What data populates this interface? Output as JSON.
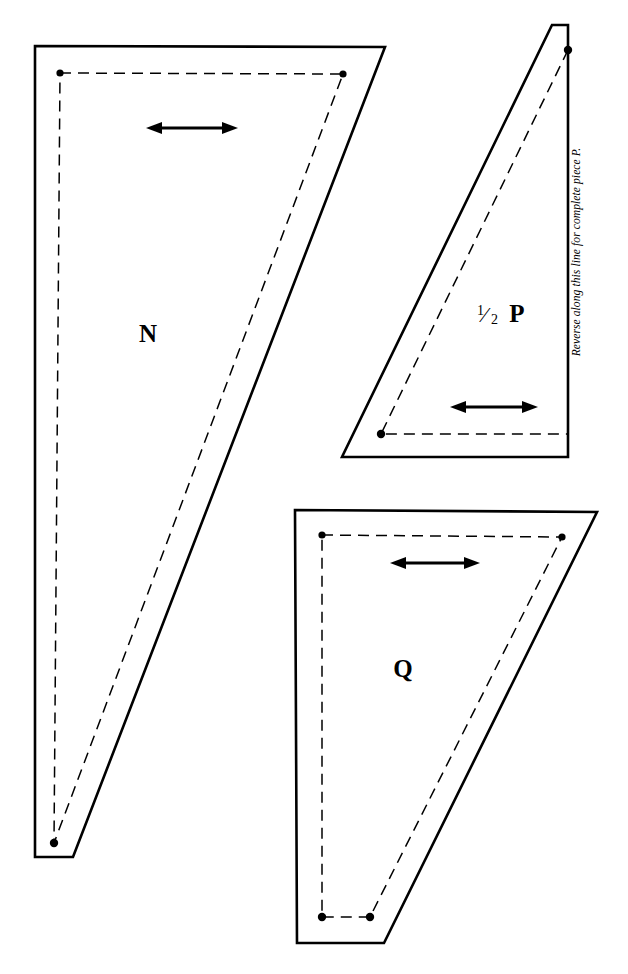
{
  "document": {
    "kind": "sewing-pattern-sheet",
    "background_color": "#ffffff",
    "ink_color": "#000000",
    "width": 628,
    "height": 974
  },
  "pieces": [
    {
      "id": "n",
      "label": "N",
      "label_x": 148,
      "label_y": 342,
      "cut_path": "M 35 46 L 385 47 L 73 857 L 35 857 Z",
      "stitch_path": "M 60 73 L 343 74 L 54 843 L 60 73",
      "dots": [
        {
          "cx": 60,
          "cy": 73,
          "r": 3.6
        },
        {
          "cx": 343,
          "cy": 74,
          "r": 3.6
        },
        {
          "cx": 54,
          "cy": 843,
          "r": 4.2
        }
      ],
      "grain_arrow": {
        "x1": 148,
        "x2": 236,
        "y": 128
      }
    },
    {
      "id": "p",
      "label_fraction_numerator": "1",
      "label_fraction_denominator": "2",
      "label": "P",
      "label_x": 500,
      "label_y": 322,
      "cut_path": "M 552 25 L 568 25 L 568 457 L 342 457 Z",
      "stitch_path": "M 568 50 L 381 434 L 568 434",
      "fold_path": "M 568 28 L 568 455",
      "dots": [
        {
          "cx": 568,
          "cy": 50,
          "r": 4.2
        },
        {
          "cx": 381,
          "cy": 434,
          "r": 4.2
        }
      ],
      "grain_arrow": {
        "x1": 452,
        "x2": 536,
        "y": 407
      },
      "fold_note": "Reverse along this line for complete piece P.",
      "fold_note_x": 580,
      "fold_note_y": 252
    },
    {
      "id": "q",
      "label": "Q",
      "label_x": 403,
      "label_y": 677,
      "cut_path": "M 295 510 L 597 512 L 384 943 L 297 943 Z",
      "stitch_path": "M 322 535 L 562 537 L 370 917 L 322 917 L 322 535",
      "dots": [
        {
          "cx": 322,
          "cy": 535,
          "r": 3.6
        },
        {
          "cx": 562,
          "cy": 537,
          "r": 3.6
        },
        {
          "cx": 370,
          "cy": 917,
          "r": 4.2
        },
        {
          "cx": 322,
          "cy": 917,
          "r": 4.2
        }
      ],
      "grain_arrow": {
        "x1": 392,
        "x2": 478,
        "y": 563
      }
    }
  ]
}
